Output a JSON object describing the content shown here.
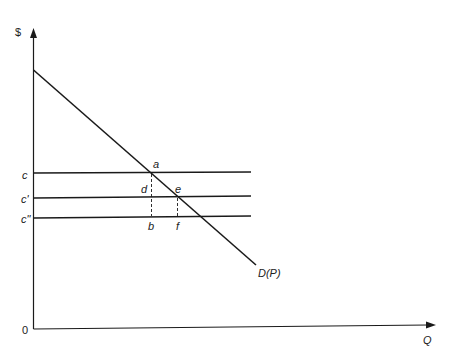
{
  "diagram": {
    "axes": {
      "y_label": "$",
      "x_label": "Q",
      "origin_label": "0"
    },
    "price_lines": [
      {
        "label": "c",
        "y": 173
      },
      {
        "label": "c'",
        "y": 197
      },
      {
        "label": "c\"",
        "y": 216
      }
    ],
    "demand_curve": {
      "label": "D(P)"
    },
    "points": {
      "a": "a",
      "b": "b",
      "d": "d",
      "e": "e",
      "f": "f"
    },
    "colors": {
      "line": "#1a1a1a",
      "background": "#ffffff"
    }
  }
}
